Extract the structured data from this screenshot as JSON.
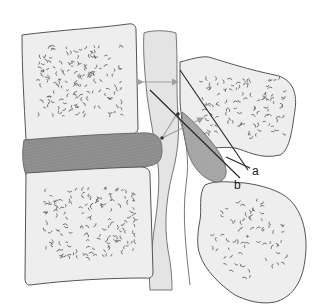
{
  "figure": {
    "colors": {
      "bone_fill": "#eeeeee",
      "disc_fill": "#8c8c8c",
      "ligament_fill": "#a6a6a6",
      "canal_fill": "#e4e4e4",
      "outline": "#555555",
      "arrow": "#a0a0a0",
      "pointer": "#222222"
    },
    "labels": {
      "a": "a",
      "b": "b"
    },
    "parts": [
      "upper-vertebral-body",
      "lower-vertebral-body",
      "intervertebral-disc",
      "spinal-canal",
      "upper-facet",
      "lower-facet",
      "ligamentum-flavum",
      "measurement-arrow-upper",
      "measurement-arrow-diagonal",
      "pointer-line-a",
      "pointer-line-b"
    ]
  }
}
